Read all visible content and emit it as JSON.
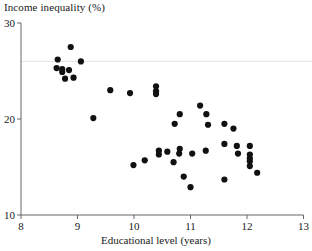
{
  "chart_data": {
    "type": "scatter",
    "title": "",
    "ylabel": "Income inequality (%)",
    "xlabel": "Educational level (years)",
    "xlim": [
      8,
      13
    ],
    "ylim": [
      10,
      30
    ],
    "xticks": [
      8,
      9,
      10,
      11,
      12,
      13
    ],
    "yticks": [
      10,
      20,
      30
    ],
    "xtick_labels": [
      "8",
      "9",
      "10",
      "11",
      "12",
      "13"
    ],
    "ytick_labels": [
      "10",
      "20",
      "30"
    ],
    "grid": false,
    "legend": null,
    "marker": "filled-circle",
    "marker_color": "#111111",
    "marker_size": 3.1,
    "points": [
      [
        8.88,
        27.5
      ],
      [
        8.65,
        26.2
      ],
      [
        9.06,
        26.0
      ],
      [
        8.63,
        25.3
      ],
      [
        8.73,
        25.2
      ],
      [
        8.73,
        24.9
      ],
      [
        8.85,
        25.1
      ],
      [
        8.78,
        24.2
      ],
      [
        8.93,
        24.3
      ],
      [
        9.28,
        20.1
      ],
      [
        9.58,
        23.0
      ],
      [
        9.93,
        22.7
      ],
      [
        10.39,
        23.4
      ],
      [
        10.39,
        22.9
      ],
      [
        10.39,
        22.6
      ],
      [
        11.17,
        21.4
      ],
      [
        10.81,
        20.5
      ],
      [
        11.28,
        20.5
      ],
      [
        10.72,
        19.5
      ],
      [
        11.31,
        19.4
      ],
      [
        11.6,
        19.5
      ],
      [
        11.76,
        19.0
      ],
      [
        11.6,
        17.4
      ],
      [
        11.82,
        17.2
      ],
      [
        12.05,
        17.2
      ],
      [
        10.81,
        16.9
      ],
      [
        10.8,
        16.4
      ],
      [
        11.03,
        16.4
      ],
      [
        11.27,
        16.7
      ],
      [
        10.44,
        16.7
      ],
      [
        10.44,
        16.3
      ],
      [
        10.59,
        16.6
      ],
      [
        11.84,
        16.4
      ],
      [
        12.05,
        16.3
      ],
      [
        12.05,
        15.9
      ],
      [
        12.05,
        15.6
      ],
      [
        10.7,
        15.5
      ],
      [
        10.19,
        15.7
      ],
      [
        9.99,
        15.2
      ],
      [
        12.05,
        15.1
      ],
      [
        12.18,
        14.4
      ],
      [
        10.88,
        14.0
      ],
      [
        11.6,
        13.7
      ],
      [
        11.0,
        12.9
      ]
    ]
  }
}
